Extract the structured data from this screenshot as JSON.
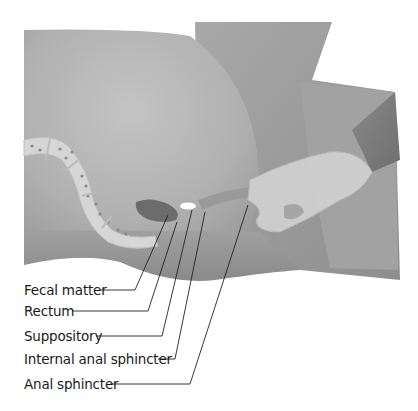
{
  "figure": {
    "type": "medical-illustration",
    "colors": {
      "skin_light": "#c9c9c9",
      "skin_mid": "#a9a9a9",
      "skin_dark": "#8c8c8c",
      "colon": "#d8d8d8",
      "fecal_matter": "#6a6a6a",
      "suppository": "#ffffff",
      "glove": "#d4d4d4",
      "leader_line": "#222222"
    }
  },
  "labels": [
    {
      "text": "Fecal matter",
      "line_end": [
        168,
        215
      ]
    },
    {
      "text": "Rectum",
      "line_end": [
        177,
        222
      ]
    },
    {
      "text": "Suppository",
      "line_end": [
        192,
        210
      ]
    },
    {
      "text": "Internal anal sphincter",
      "line_end": [
        205,
        212
      ]
    },
    {
      "text": "Anal sphincter",
      "line_end": [
        248,
        205
      ]
    }
  ]
}
